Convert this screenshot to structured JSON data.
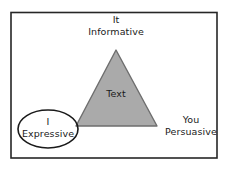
{
  "figure": {
    "name": "rhetorical-triangle-diagram",
    "background_color": "#ffffff",
    "frame_color": "#262626",
    "triangle": {
      "label": "Text",
      "fill_color": "#aaaaaa",
      "stroke_color": "#6e6e6e",
      "apex": {
        "x": 116,
        "y": 50
      },
      "base_left": {
        "x": 76,
        "y": 126
      },
      "base_right": {
        "x": 157,
        "y": 126
      }
    },
    "ellipse": {
      "stroke_color": "#1a1a1a",
      "fill_color": "#ffffff",
      "center": {
        "x": 48,
        "y": 129
      },
      "radius_x": 30,
      "radius_y": 19
    },
    "corners": {
      "top": {
        "pronoun": "It",
        "appeal": "Informative"
      },
      "bottom_left": {
        "pronoun": "I",
        "appeal": "Expressive"
      },
      "bottom_right": {
        "pronoun": "You",
        "appeal": "Persuasive"
      }
    }
  }
}
